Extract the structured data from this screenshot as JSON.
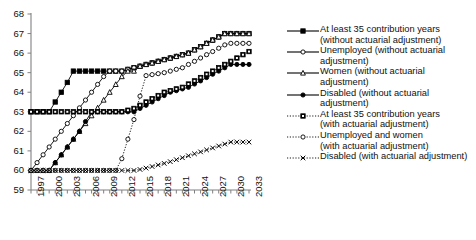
{
  "chart_data": {
    "type": "line",
    "title": "",
    "xlabel": "",
    "ylabel": "",
    "xlim": [
      1997,
      2033
    ],
    "ylim": [
      59,
      68
    ],
    "ytick_labels": [
      "68",
      "67",
      "66",
      "65",
      "64",
      "63",
      "62",
      "61",
      "60",
      "59"
    ],
    "yticks": [
      68,
      67,
      66,
      65,
      64,
      63,
      62,
      61,
      60,
      59
    ],
    "xtick_labels": [
      "1997",
      "2000",
      "2003",
      "2006",
      "2009",
      "2012",
      "2015",
      "2018",
      "2021",
      "2024",
      "2027",
      "2030",
      "2033"
    ],
    "xticks": [
      1997,
      2000,
      2003,
      2006,
      2009,
      2012,
      2015,
      2018,
      2021,
      2024,
      2027,
      2030,
      2033
    ],
    "grid": false,
    "legend_position": "right",
    "x": [
      1997,
      1998,
      1999,
      2000,
      2001,
      2002,
      2003,
      2004,
      2005,
      2006,
      2007,
      2008,
      2009,
      2010,
      2011,
      2012,
      2013,
      2014,
      2015,
      2016,
      2017,
      2018,
      2019,
      2020,
      2021,
      2022,
      2023,
      2024,
      2025,
      2026,
      2027,
      2028,
      2029,
      2030,
      2031,
      2032,
      2033
    ],
    "series": [
      {
        "name": "At least 35 contribution years (without actuarial adjustment)",
        "marker": "filled-square",
        "dash": "solid",
        "values": [
          63,
          63,
          63,
          63,
          63.5,
          64,
          64.5,
          65.08,
          65.08,
          65.08,
          65.08,
          65.08,
          65.08,
          65.08,
          65.08,
          65.08,
          65.17,
          65.25,
          65.33,
          65.42,
          65.5,
          65.58,
          65.67,
          65.75,
          65.83,
          65.92,
          66,
          66.17,
          66.33,
          66.5,
          66.67,
          66.83,
          67,
          67,
          67,
          67,
          67
        ]
      },
      {
        "name": "Unemployed (without actuarial adjustment)",
        "marker": "open-circle",
        "dash": "solid",
        "values": [
          60,
          60.4,
          60.8,
          61.2,
          61.6,
          62,
          62.4,
          62.8,
          63.2,
          63.6,
          64,
          64.4,
          64.8,
          65.08,
          65.08,
          65.08,
          65.17,
          65.25,
          65.33,
          65.42,
          65.5,
          65.58,
          65.67,
          65.75,
          65.83,
          65.92,
          66,
          66.17,
          66.33,
          66.5,
          66.67,
          66.83,
          67,
          67,
          67,
          67,
          67
        ]
      },
      {
        "name": "Women (without actuarial adjustment)",
        "marker": "open-triangle",
        "dash": "solid",
        "values": [
          60,
          60,
          60,
          60,
          60.4,
          60.8,
          61.2,
          61.6,
          62,
          62.4,
          62.8,
          63.2,
          63.6,
          64,
          64.4,
          64.8,
          65.08,
          65.08,
          65.33,
          65.42,
          65.5,
          65.58,
          65.67,
          65.75,
          65.83,
          65.92,
          66,
          66.17,
          66.33,
          66.5,
          66.67,
          66.83,
          67,
          67,
          67,
          67,
          67
        ]
      },
      {
        "name": "Disabled (without actuarial adjustment)",
        "marker": "filled-circle",
        "dash": "solid",
        "values": [
          60,
          60,
          60,
          60,
          60.4,
          60.8,
          61.2,
          61.6,
          62,
          62.5,
          63,
          63,
          63,
          63,
          63,
          63,
          63,
          63,
          63.17,
          63.33,
          63.5,
          63.67,
          63.83,
          64,
          64.08,
          64.17,
          64.25,
          64.42,
          64.58,
          64.75,
          64.92,
          65.08,
          65.25,
          65.42,
          65.42,
          65.42,
          65.42
        ]
      },
      {
        "name": "At least 35 contribution years (with actuarial adjustment)",
        "marker": "dotted-square",
        "dash": "dotted",
        "values": [
          63,
          63,
          63,
          63,
          63,
          63,
          63,
          63,
          63,
          63,
          63,
          63,
          63,
          63,
          63,
          63,
          63.08,
          63.17,
          63.33,
          63.5,
          63.67,
          63.83,
          64,
          64.08,
          64.17,
          64.25,
          64.42,
          64.58,
          64.75,
          64.92,
          65.08,
          65.25,
          65.42,
          65.58,
          65.75,
          65.92,
          66.08
        ]
      },
      {
        "name": "Unemployed and women (with actuarial adjustment)",
        "marker": "dotted-circle",
        "dash": "dotted",
        "values": [
          60,
          60,
          60,
          60,
          60,
          60,
          60,
          60,
          60,
          60,
          60,
          60,
          60,
          60,
          60,
          60.6,
          61.6,
          62.6,
          63.8,
          64.85,
          64.9,
          64.95,
          65,
          65.08,
          65.17,
          65.25,
          65.42,
          65.58,
          65.75,
          65.92,
          66.08,
          66.25,
          66.42,
          66.5,
          66.5,
          66.5,
          66.5
        ]
      },
      {
        "name": "Disabled (with actuarial adjustment)",
        "marker": "dotted-x",
        "dash": "dotted",
        "values": [
          60,
          60,
          60,
          60,
          60,
          60,
          60,
          60,
          60,
          60,
          60,
          60,
          60,
          60,
          60,
          60,
          60,
          60,
          60.05,
          60.12,
          60.2,
          60.28,
          60.36,
          60.45,
          60.55,
          60.65,
          60.75,
          60.85,
          60.95,
          61.05,
          61.15,
          61.25,
          61.35,
          61.45,
          61.45,
          61.45,
          61.45
        ]
      }
    ]
  },
  "legend": {
    "entries": [
      {
        "label_line1": "At least 35 contribution years",
        "label_line2": "(without actuarial adjustment)",
        "key": "filled-square-solid"
      },
      {
        "label_line1": "Unemployed (without actuarial",
        "label_line2": "adjustment)",
        "key": "open-circle-solid"
      },
      {
        "label_line1": "Women (without actuarial",
        "label_line2": "adjustment)",
        "key": "open-triangle-solid"
      },
      {
        "label_line1": "Disabled (without actuarial",
        "label_line2": "adjustment)",
        "key": "filled-circle-solid"
      },
      {
        "label_line1": "At least 35 contribution years",
        "label_line2": "(with actuarial adjustment)",
        "key": "dotted-square"
      },
      {
        "label_line1": "Unemployed and women",
        "label_line2": "(with actuarial adjustment)",
        "key": "dotted-circle"
      },
      {
        "label_line1": "Disabled (with actuarial adjustment)",
        "label_line2": "",
        "key": "dotted-x"
      }
    ]
  },
  "colors": {
    "line": "#000000",
    "axis": "#808080",
    "background": "#ffffff"
  }
}
